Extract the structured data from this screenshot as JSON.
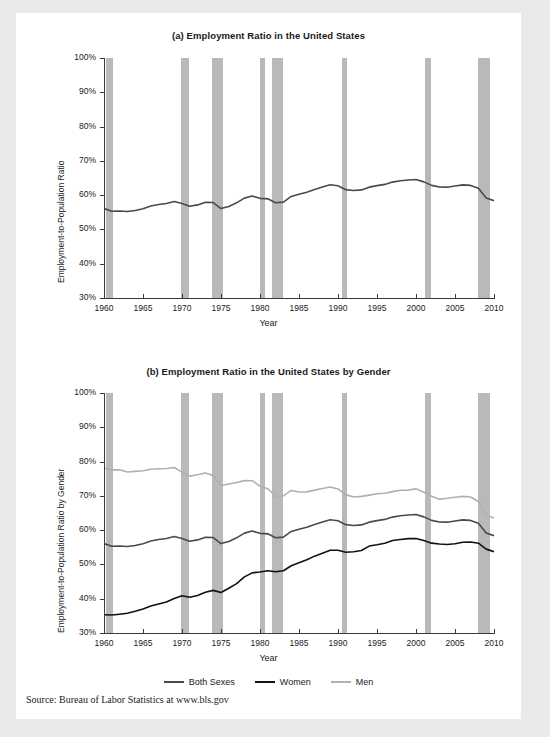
{
  "figure": {
    "source_note": "Source: Bureau of Labor Statistics at www.bls.gov",
    "colors": {
      "both_sexes": "#4a4a4a",
      "women": "#111111",
      "men": "#b0b0b0",
      "recession_band": "#b9b9b9",
      "axis": "#3a3a3a",
      "panel_background": "#ffffff",
      "page_background": "#e9eaec"
    }
  },
  "legend": {
    "position": "bottom-center",
    "entries": [
      {
        "label": "Both Sexes",
        "color": "#4a4a4a"
      },
      {
        "label": "Women",
        "color": "#111111"
      },
      {
        "label": "Men",
        "color": "#b0b0b0"
      }
    ]
  },
  "chart_data": [
    {
      "id": "panel-a",
      "type": "line",
      "title": "(a) Employment Ratio in the United States",
      "xlabel": "Year",
      "ylabel": "Employment-to-Population Ratio",
      "xlim": [
        1960,
        2010
      ],
      "ylim": [
        30,
        100
      ],
      "ytick_labels": [
        "100%",
        "90%",
        "80%",
        "70%",
        "60%",
        "50%",
        "40%",
        "30%"
      ],
      "ytick_values": [
        100,
        90,
        80,
        70,
        60,
        50,
        40,
        30
      ],
      "xtick_labels": [
        "1960",
        "1965",
        "1970",
        "1975",
        "1980",
        "1985",
        "1990",
        "1995",
        "2000",
        "2005",
        "2010"
      ],
      "xtick_values": [
        1960,
        1965,
        1970,
        1975,
        1980,
        1985,
        1990,
        1995,
        2000,
        2005,
        2010
      ],
      "grid": false,
      "recession_bands": [
        {
          "start": 1960.3,
          "end": 1961.2
        },
        {
          "start": 1969.9,
          "end": 1970.9
        },
        {
          "start": 1973.9,
          "end": 1975.2
        },
        {
          "start": 1980.0,
          "end": 1980.6
        },
        {
          "start": 1981.5,
          "end": 1982.9
        },
        {
          "start": 1990.5,
          "end": 1991.2
        },
        {
          "start": 2001.2,
          "end": 2001.9
        },
        {
          "start": 2007.9,
          "end": 2009.5
        }
      ],
      "series": [
        {
          "name": "Both Sexes",
          "color": "#4a4a4a",
          "x": [
            1960,
            1961,
            1962,
            1963,
            1964,
            1965,
            1966,
            1967,
            1968,
            1969,
            1970,
            1971,
            1972,
            1973,
            1974,
            1975,
            1976,
            1977,
            1978,
            1979,
            1980,
            1981,
            1982,
            1983,
            1984,
            1985,
            1986,
            1987,
            1988,
            1989,
            1990,
            1991,
            1992,
            1993,
            1994,
            1995,
            1996,
            1997,
            1998,
            1999,
            2000,
            2001,
            2002,
            2003,
            2004,
            2005,
            2006,
            2007,
            2008,
            2009,
            2010
          ],
          "values": [
            56.1,
            55.4,
            55.5,
            55.4,
            55.7,
            56.2,
            56.9,
            57.3,
            57.5,
            58.0,
            57.4,
            56.6,
            57.0,
            57.8,
            57.8,
            56.1,
            56.8,
            57.9,
            59.3,
            59.9,
            59.2,
            59.0,
            57.8,
            57.9,
            59.5,
            60.1,
            60.7,
            61.5,
            62.3,
            63.0,
            62.8,
            61.7,
            61.5,
            61.7,
            62.5,
            62.9,
            63.2,
            63.8,
            64.1,
            64.3,
            64.4,
            63.7,
            62.7,
            62.3,
            62.3,
            62.7,
            63.1,
            63.0,
            62.2,
            59.3,
            58.5
          ]
        }
      ]
    },
    {
      "id": "panel-b",
      "type": "line",
      "title": "(b) Employment Ratio in the United States by Gender",
      "xlabel": "Year",
      "ylabel": "Employment-to-Population Ratio by Gender",
      "xlim": [
        1960,
        2010
      ],
      "ylim": [
        30,
        100
      ],
      "ytick_labels": [
        "100%",
        "90%",
        "80%",
        "70%",
        "60%",
        "50%",
        "40%",
        "30%"
      ],
      "ytick_values": [
        100,
        90,
        80,
        70,
        60,
        50,
        40,
        30
      ],
      "xtick_labels": [
        "1960",
        "1965",
        "1970",
        "1975",
        "1980",
        "1985",
        "1990",
        "1995",
        "2000",
        "2005",
        "2010"
      ],
      "xtick_values": [
        1960,
        1965,
        1970,
        1975,
        1980,
        1985,
        1990,
        1995,
        2000,
        2005,
        2010
      ],
      "grid": false,
      "recession_bands": [
        {
          "start": 1960.3,
          "end": 1961.2
        },
        {
          "start": 1969.9,
          "end": 1970.9
        },
        {
          "start": 1973.9,
          "end": 1975.2
        },
        {
          "start": 1980.0,
          "end": 1980.6
        },
        {
          "start": 1981.5,
          "end": 1982.9
        },
        {
          "start": 1990.5,
          "end": 1991.2
        },
        {
          "start": 2001.2,
          "end": 2001.9
        },
        {
          "start": 2007.9,
          "end": 2009.5
        }
      ],
      "series": [
        {
          "name": "Men",
          "color": "#b0b0b0",
          "x": [
            1960,
            1961,
            1962,
            1963,
            1964,
            1965,
            1966,
            1967,
            1968,
            1969,
            1970,
            1971,
            1972,
            1973,
            1974,
            1975,
            1976,
            1977,
            1978,
            1979,
            1980,
            1981,
            1982,
            1983,
            1984,
            1985,
            1986,
            1987,
            1988,
            1989,
            1990,
            1991,
            1992,
            1993,
            1994,
            1995,
            1996,
            1997,
            1998,
            1999,
            2000,
            2001,
            2002,
            2003,
            2004,
            2005,
            2006,
            2007,
            2008,
            2009,
            2010
          ],
          "values": [
            78.0,
            77.6,
            77.7,
            77.1,
            77.3,
            77.5,
            77.9,
            78.0,
            78.0,
            78.2,
            76.8,
            75.6,
            76.0,
            76.5,
            75.8,
            73.0,
            73.5,
            74.0,
            74.6,
            74.6,
            73.0,
            72.2,
            70.0,
            70.0,
            71.5,
            71.0,
            71.0,
            71.5,
            72.0,
            72.5,
            72.0,
            70.4,
            69.8,
            70.0,
            70.4,
            70.8,
            70.9,
            71.3,
            71.6,
            71.6,
            71.9,
            70.9,
            69.7,
            68.9,
            69.2,
            69.6,
            69.9,
            69.8,
            68.5,
            64.5,
            63.7
          ]
        },
        {
          "name": "Both Sexes",
          "color": "#4a4a4a",
          "x": [
            1960,
            1961,
            1962,
            1963,
            1964,
            1965,
            1966,
            1967,
            1968,
            1969,
            1970,
            1971,
            1972,
            1973,
            1974,
            1975,
            1976,
            1977,
            1978,
            1979,
            1980,
            1981,
            1982,
            1983,
            1984,
            1985,
            1986,
            1987,
            1988,
            1989,
            1990,
            1991,
            1992,
            1993,
            1994,
            1995,
            1996,
            1997,
            1998,
            1999,
            2000,
            2001,
            2002,
            2003,
            2004,
            2005,
            2006,
            2007,
            2008,
            2009,
            2010
          ],
          "values": [
            56.1,
            55.4,
            55.5,
            55.4,
            55.7,
            56.2,
            56.9,
            57.3,
            57.5,
            58.0,
            57.4,
            56.6,
            57.0,
            57.8,
            57.8,
            56.1,
            56.8,
            57.9,
            59.3,
            59.9,
            59.2,
            59.0,
            57.8,
            57.9,
            59.5,
            60.1,
            60.7,
            61.5,
            62.3,
            63.0,
            62.8,
            61.7,
            61.5,
            61.7,
            62.5,
            62.9,
            63.2,
            63.8,
            64.1,
            64.3,
            64.4,
            63.7,
            62.7,
            62.3,
            62.3,
            62.7,
            63.1,
            63.0,
            62.2,
            59.3,
            58.5
          ]
        },
        {
          "name": "Women",
          "color": "#111111",
          "x": [
            1960,
            1961,
            1962,
            1963,
            1964,
            1965,
            1966,
            1967,
            1968,
            1969,
            1970,
            1971,
            1972,
            1973,
            1974,
            1975,
            1976,
            1977,
            1978,
            1979,
            1980,
            1981,
            1982,
            1983,
            1984,
            1985,
            1986,
            1987,
            1988,
            1989,
            1990,
            1991,
            1992,
            1993,
            1994,
            1995,
            1996,
            1997,
            1998,
            1999,
            2000,
            2001,
            2002,
            2003,
            2004,
            2005,
            2006,
            2007,
            2008,
            2009,
            2010
          ],
          "values": [
            35.5,
            35.4,
            35.6,
            35.8,
            36.3,
            36.9,
            37.7,
            38.3,
            38.9,
            39.9,
            40.8,
            40.4,
            41.0,
            42.0,
            42.6,
            42.0,
            43.2,
            44.5,
            46.4,
            47.5,
            47.7,
            48.0,
            47.7,
            48.0,
            49.5,
            50.4,
            51.4,
            52.5,
            53.4,
            54.3,
            54.3,
            53.7,
            53.8,
            54.1,
            55.3,
            55.6,
            56.0,
            56.8,
            57.1,
            57.4,
            57.5,
            57.0,
            56.3,
            56.1,
            56.0,
            56.2,
            56.6,
            56.6,
            56.2,
            54.4,
            53.6
          ]
        }
      ]
    }
  ]
}
